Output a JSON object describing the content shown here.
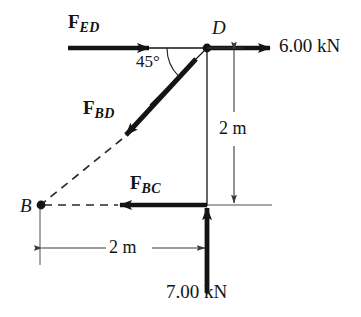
{
  "figure": {
    "background_color": "#ffffff",
    "ink_color": "#141414"
  },
  "nodes": [
    {
      "id": "D",
      "label": "D",
      "x": 207,
      "y": 48
    },
    {
      "id": "B",
      "label": "B",
      "x": 40,
      "y": 205
    }
  ],
  "forces": [
    {
      "id": "F_ED",
      "symbol": "F",
      "subscript": "ED",
      "direction": "right",
      "style": "bold-arrow"
    },
    {
      "id": "F_BD",
      "symbol": "F",
      "subscript": "BD",
      "direction": "down-left-45",
      "style": "bold-arrow"
    },
    {
      "id": "F_BC",
      "symbol": "F",
      "subscript": "BC",
      "direction": "left",
      "style": "bold-arrow"
    }
  ],
  "magnitudes": [
    {
      "id": "load-right",
      "value": "6.00 kN",
      "direction": "right"
    },
    {
      "id": "load-bottom",
      "value": "7.00 kN",
      "direction": "up"
    }
  ],
  "dimensions": [
    {
      "id": "dim-vertical",
      "value": "2 m",
      "orientation": "vertical"
    },
    {
      "id": "dim-horizontal",
      "value": "2 m",
      "orientation": "horizontal"
    }
  ],
  "angles": [
    {
      "id": "angle-bd",
      "value": "45°"
    }
  ]
}
